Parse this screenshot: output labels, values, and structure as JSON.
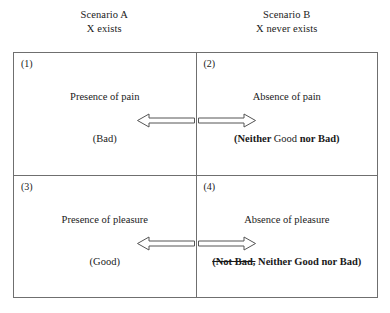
{
  "headers": [
    {
      "line1": "Scenario A",
      "line2": "X exists"
    },
    {
      "line1": "Scenario B",
      "line2": "X never exists"
    }
  ],
  "quadrants": [
    {
      "label": "(1)",
      "statement": "Presence of pain",
      "valuation": {
        "parts": [
          {
            "text": "(Bad)",
            "bold": false,
            "strike": false
          }
        ]
      },
      "arrow": {
        "direction": "left",
        "name": "arrow-left-icon"
      }
    },
    {
      "label": "(2)",
      "statement": "Absence of pain",
      "valuation": {
        "parts": [
          {
            "text": "(Neither ",
            "bold": true,
            "strike": false
          },
          {
            "text": "Good ",
            "bold": false,
            "strike": false
          },
          {
            "text": "nor Bad)",
            "bold": true,
            "strike": false
          }
        ]
      },
      "arrow": {
        "direction": "right",
        "name": "arrow-right-icon"
      }
    },
    {
      "label": "(3)",
      "statement": "Presence of pleasure",
      "valuation": {
        "parts": [
          {
            "text": "(Good)",
            "bold": false,
            "strike": false
          }
        ]
      },
      "arrow": {
        "direction": "left",
        "name": "arrow-left-icon"
      }
    },
    {
      "label": "(4)",
      "statement": "Absence of pleasure",
      "valuation": {
        "parts": [
          {
            "text": "(Not Bad,",
            "bold": true,
            "strike": true
          },
          {
            "text": " Neither Good nor Bad)",
            "bold": true,
            "strike": false
          }
        ]
      },
      "arrow": {
        "direction": "right",
        "name": "arrow-right-icon"
      }
    }
  ],
  "colors": {
    "border": "#6f6f6f",
    "text": "#1a1a1a",
    "arrow_stroke": "#555555",
    "background": "#ffffff"
  }
}
